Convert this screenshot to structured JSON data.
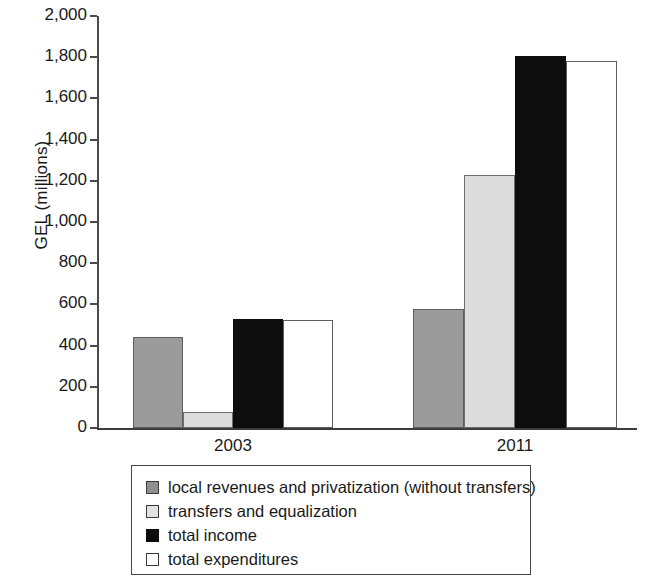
{
  "chart_data": {
    "type": "bar",
    "title": "",
    "xlabel": "",
    "ylabel": "GEL (millions)",
    "categories": [
      "2003",
      "2011"
    ],
    "ylim": [
      0,
      2000
    ],
    "ytick_step": 200,
    "yticks": [
      {
        "value": 2000,
        "label": "2,000"
      },
      {
        "value": 1800,
        "label": "1,800"
      },
      {
        "value": 1600,
        "label": "1,600"
      },
      {
        "value": 1400,
        "label": "1,400"
      },
      {
        "value": 1200,
        "label": "1,200"
      },
      {
        "value": 1000,
        "label": "1,000"
      },
      {
        "value": 800,
        "label": "800"
      },
      {
        "value": 600,
        "label": "600"
      },
      {
        "value": 400,
        "label": "400"
      },
      {
        "value": 200,
        "label": "200"
      },
      {
        "value": 0,
        "label": "0"
      }
    ],
    "grid": false,
    "legend_position": "bottom",
    "series": [
      {
        "name": "local revenues and privatization (without transfers)",
        "color": "#9b9b9b",
        "values": [
          442,
          578
        ]
      },
      {
        "name": "transfers and equalization",
        "color": "#dcdcdc",
        "values": [
          78,
          1228
        ]
      },
      {
        "name": "total income",
        "color": "#0d0d0d",
        "values": [
          529,
          1806
        ]
      },
      {
        "name": "total expenditures",
        "color": "#ffffff",
        "values": [
          524,
          1782
        ]
      }
    ]
  }
}
